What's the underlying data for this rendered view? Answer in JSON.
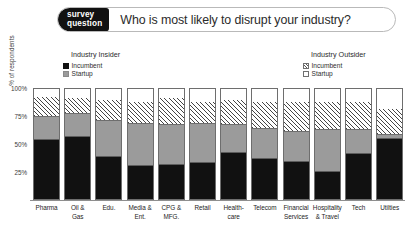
{
  "header": {
    "badge_line1": "survey",
    "badge_line2": "question",
    "question": "Who is most likely to disrupt your industry?"
  },
  "legends": {
    "insider": {
      "title": "Industry Insider",
      "items": [
        {
          "label": "Incumbent",
          "swatch": "solid-black",
          "color": "#111111"
        },
        {
          "label": "Startup",
          "swatch": "solid-gray",
          "color": "#9b9b9b"
        }
      ]
    },
    "outsider": {
      "title": "Industry Outsider",
      "items": [
        {
          "label": "Incumbent",
          "swatch": "diagonal-hatch",
          "color": "#ffffff"
        },
        {
          "label": "Startup",
          "swatch": "solid-white",
          "color": "#ffffff"
        }
      ]
    }
  },
  "chart_data": {
    "type": "bar",
    "stacked": true,
    "stack_total": 100,
    "title": "Who is most likely to disrupt your industry?",
    "xlabel": "",
    "ylabel": "% of respondents",
    "ylim": [
      0,
      100
    ],
    "yticks": [
      25,
      50,
      75,
      100
    ],
    "ytick_labels": [
      "25%",
      "50%",
      "75%",
      "100%"
    ],
    "grid": false,
    "legend_position": "top",
    "categories": [
      "Pharma",
      "Oil & Gas",
      "Edu.",
      "Media & Ent.",
      "CPG & MFG.",
      "Retail",
      "Health-care",
      "Telecom",
      "Financial Services",
      "Hospitality & Travel",
      "Tech",
      "Utilties"
    ],
    "category_lines": [
      [
        "Pharma"
      ],
      [
        "Oil &",
        "Gas"
      ],
      [
        "Edu."
      ],
      [
        "Media &",
        "Ent."
      ],
      [
        "CPG &",
        "MFG."
      ],
      [
        "Retail"
      ],
      [
        "Health-",
        "care"
      ],
      [
        "Telecom"
      ],
      [
        "Financial",
        "Services"
      ],
      [
        "Hospitality",
        "& Travel"
      ],
      [
        "Tech"
      ],
      [
        "Utilties"
      ]
    ],
    "series": [
      {
        "name": "Industry Insider - Incumbent",
        "key": "incumbent_insider",
        "color": "#111111",
        "pattern": "solid",
        "values": [
          54,
          56,
          38,
          30,
          31,
          33,
          42,
          36,
          34,
          25,
          41,
          55
        ]
      },
      {
        "name": "Industry Insider - Startup",
        "key": "startup_insider",
        "color": "#9b9b9b",
        "pattern": "solid",
        "values": [
          21,
          21,
          33,
          38,
          36,
          35,
          25,
          28,
          27,
          38,
          22,
          3
        ]
      },
      {
        "name": "Industry Outsider - Incumbent",
        "key": "incumbent_outsider",
        "color": "#ffffff",
        "pattern": "diagonal-hatch",
        "values": [
          18,
          15,
          19,
          20,
          25,
          20,
          23,
          24,
          27,
          25,
          25,
          24
        ]
      },
      {
        "name": "Industry Outsider - Startup",
        "key": "startup_outsider",
        "color": "#ffffff",
        "pattern": "solid",
        "values": [
          7,
          8,
          10,
          12,
          8,
          12,
          10,
          12,
          12,
          12,
          12,
          18
        ]
      }
    ]
  }
}
